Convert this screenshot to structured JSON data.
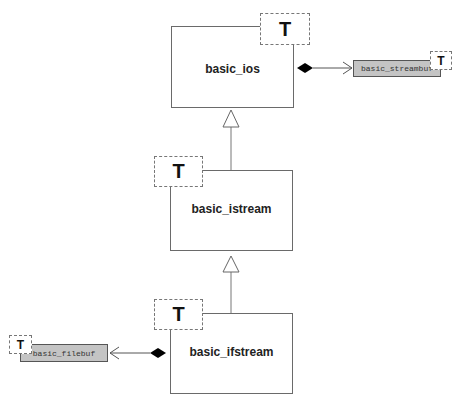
{
  "diagram": {
    "type": "UML class diagram",
    "classes": [
      {
        "id": "basic_ios",
        "name": "basic_ios",
        "template_param": "T"
      },
      {
        "id": "basic_istream",
        "name": "basic_istream",
        "template_param": "T"
      },
      {
        "id": "basic_ifstream",
        "name": "basic_ifstream",
        "template_param": "T"
      },
      {
        "id": "basic_streambuf",
        "name": "basic_streambuf",
        "template_param": "T",
        "style": "shaded"
      },
      {
        "id": "basic_filebuf",
        "name": "basic_filebuf",
        "template_param": "T",
        "style": "shaded"
      }
    ],
    "relationships": [
      {
        "type": "inheritance",
        "from": "basic_istream",
        "to": "basic_ios"
      },
      {
        "type": "inheritance",
        "from": "basic_ifstream",
        "to": "basic_istream"
      },
      {
        "type": "composition",
        "owner": "basic_ios",
        "part": "basic_streambuf"
      },
      {
        "type": "composition",
        "owner": "basic_ifstream",
        "part": "basic_filebuf"
      }
    ],
    "colors": {
      "box_border": "#6a6a6a",
      "shaded_fill": "#c4c4c4",
      "line": "#555555",
      "diamond": "#000000"
    }
  },
  "caption": {
    "text": "",
    "clipped": true
  }
}
